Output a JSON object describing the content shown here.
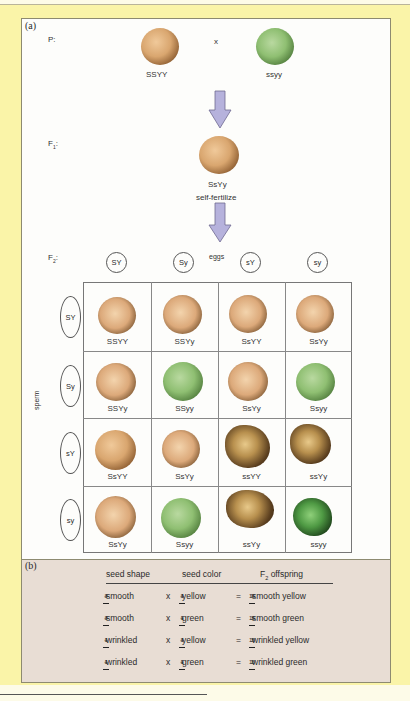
{
  "panel_a": {
    "tag": "(a)",
    "p_label": "P:",
    "f1_label": "F",
    "f1_sub": "1",
    "f1_colon": ":",
    "f2_label": "F",
    "f2_sub": "2",
    "f2_colon": ":",
    "cross_symbol": "x",
    "parent_left": {
      "genotype": "SSYY",
      "phenotype": "smooth yellow"
    },
    "parent_right": {
      "genotype": "ssyy",
      "phenotype": "wrinkled green"
    },
    "f1_seed": {
      "genotype": "SsYy",
      "phenotype": "smooth yellow"
    },
    "self_fertilize": "self-fertilize",
    "eggs_label": "eggs",
    "sperm_label": "sperm",
    "egg_gametes": [
      "SY",
      "Sy",
      "sY",
      "sy"
    ],
    "sperm_gametes": [
      "SY",
      "Sy",
      "sY",
      "sy"
    ],
    "arrow_color": "#b6b2dc",
    "punnett": [
      [
        {
          "g": "SSYY",
          "p": "tan"
        },
        {
          "g": "SSYy",
          "p": "tan"
        },
        {
          "g": "SsYY",
          "p": "tan"
        },
        {
          "g": "SsYy",
          "p": "tan"
        }
      ],
      [
        {
          "g": "SSYy",
          "p": "tan"
        },
        {
          "g": "SSyy",
          "p": "grn"
        },
        {
          "g": "SsYy",
          "p": "tan"
        },
        {
          "g": "Ssyy",
          "p": "grn"
        }
      ],
      [
        {
          "g": "SsYY",
          "p": "tan"
        },
        {
          "g": "SsYy",
          "p": "tan"
        },
        {
          "g": "ssYY",
          "p": "wrk"
        },
        {
          "g": "ssYy",
          "p": "wrk"
        }
      ],
      [
        {
          "g": "SsYy",
          "p": "tan"
        },
        {
          "g": "Ssyy",
          "p": "grn"
        },
        {
          "g": "ssYy",
          "p": "wrk"
        },
        {
          "g": "ssyy",
          "p": "wrkg"
        }
      ]
    ]
  },
  "panel_b": {
    "tag": "(b)",
    "headers": {
      "shape": "seed shape",
      "color": "seed color",
      "offspring": "F",
      "offspring_sub": "2",
      "offspring_rest": " offspring"
    },
    "rows": [
      {
        "s_num": "3",
        "s_den": "4",
        "shape": "smooth",
        "c_num": "3",
        "c_den": "4",
        "color": "yellow",
        "o_num": "9",
        "o_den": "16",
        "offspring": "smooth yellow"
      },
      {
        "s_num": "3",
        "s_den": "4",
        "shape": "smooth",
        "c_num": "1",
        "c_den": "4",
        "color": "green",
        "o_num": "3",
        "o_den": "16",
        "offspring": "smooth green"
      },
      {
        "s_num": "1",
        "s_den": "4",
        "shape": "wrinkled",
        "c_num": "3",
        "c_den": "4",
        "color": "yellow",
        "o_num": "3",
        "o_den": "16",
        "offspring": "wrinkled yellow"
      },
      {
        "s_num": "1",
        "s_den": "4",
        "shape": "wrinkled",
        "c_num": "1",
        "c_den": "4",
        "color": "green",
        "o_num": "1",
        "o_den": "16",
        "offspring": "wrinkled green"
      }
    ],
    "times": "x",
    "equals": "="
  }
}
